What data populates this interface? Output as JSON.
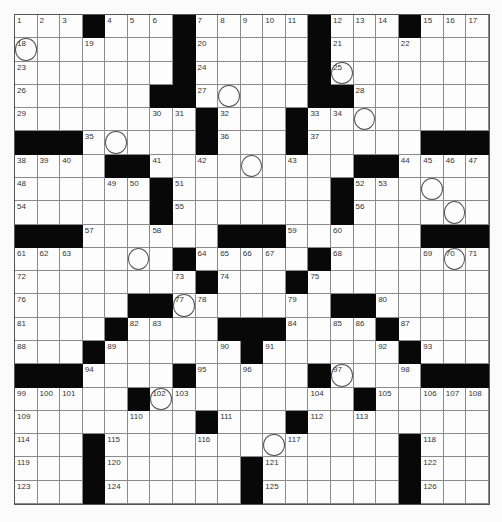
{
  "puzzle": {
    "rows": 21,
    "cols": 21,
    "grid": [
      "1,2,3,#,4,5,6,#,7,8,9,10,11,#,12,13,14,#,15,16,17",
      "18o,.,.,19,.,.,.,#,20,.,.,.,.,#,21,.,.,22,.,.,.",
      "23,.,.,.,.,.,.,#,24,.,.,.,.,#,25o,.,.,.,.,.,.",
      "26,.,.,.,.,.,#,#,27,o,.,.,.,#,#,28,.,.,.,.,.",
      "29,.,.,.,.,.,30,31,#,32,.,.,#,33,34,o,.,.,.,.,.",
      "#,#,#,35,o,.,.,.,#,36,.,.,#,37,.,.,.,.,#,#,#",
      "38,39,40,.,#,#,41,.,42,.,o,.,43,.,.,#,#,44,45,46,47",
      "48,.,.,.,49,50,#,51,.,.,.,.,.,.,#,52,53,.,o,.,.",
      "54,.,.,.,.,.,#,55,.,.,.,.,.,.,#,56,.,.,.,o,.",
      "#,#,#,57,.,.,58,.,.,#,#,#,59,.,60,.,.,.,#,#,#",
      "61,62,63,.,.,o,.,#,64,65,66,67,.,#,68,.,.,.,69,70o,71",
      "72,.,.,.,.,.,.,73,#,74,.,.,#,75,.,.,.,.,.,.,.",
      "76,.,.,.,.,#,#,77o,78,.,.,.,79,.,#,#,80,.,.,.,.",
      "81,.,.,.,#,82,83,.,.,#,#,#,84,.,85,86,#,87,.,.,.",
      "88,.,.,#,89,.,.,.,.,90,#,91,.,.,.,.,92,#,93,.,.",
      "#,#,#,94,.,.,.,#,95,.,96,.,.,#,97o,.,.,98,#,#,#",
      "99,100,101,.,.,#,102o,103,.,.,.,.,.,104,.,#,105,.,106,107,108",
      "109,.,.,.,.,110,.,.,#,111,.,.,#,112,.,113,.,.,.,.,.",
      "114,.,.,#,115,.,.,.,116,.,.,o,117,.,.,.,.,#,118,.,.",
      "119,.,.,#,120,.,.,.,.,.,#,121,.,.,.,.,.,#,122,.,.",
      "123,.,.,#,124,.,.,.,.,.,#,125,.,.,.,.,.,#,126,.,."
    ],
    "legend": {
      "#": "black square",
      ".": "empty white square",
      "o": "circled square",
      "N": "numbered square",
      "No": "numbered and circled square"
    }
  }
}
